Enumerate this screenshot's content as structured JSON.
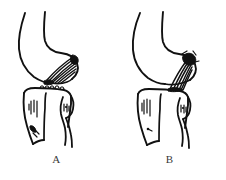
{
  "figure": {
    "type": "medical-line-illustration",
    "background_color": "#ffffff",
    "ink_color": "#111111",
    "label_color": "#3a3a3a",
    "width": 226,
    "height": 180
  },
  "panels": [
    {
      "id": "A",
      "label": "A",
      "condition": "intact-ligament",
      "structures": [
        "femur",
        "femoral-condyle",
        "intercondylar-notch",
        "cruciate-ligament-intact",
        "tibia",
        "tibial-plateau",
        "tibial-eminence",
        "fibula",
        "fibular-head"
      ]
    },
    {
      "id": "B",
      "label": "B",
      "condition": "avulsed-ligament",
      "structures": [
        "femur",
        "femoral-condyle",
        "intercondylar-notch",
        "cruciate-ligament-avulsed",
        "bone-avulsion-fragment",
        "tibia",
        "tibial-plateau",
        "tibial-eminence",
        "fibula",
        "fibular-head"
      ]
    }
  ]
}
